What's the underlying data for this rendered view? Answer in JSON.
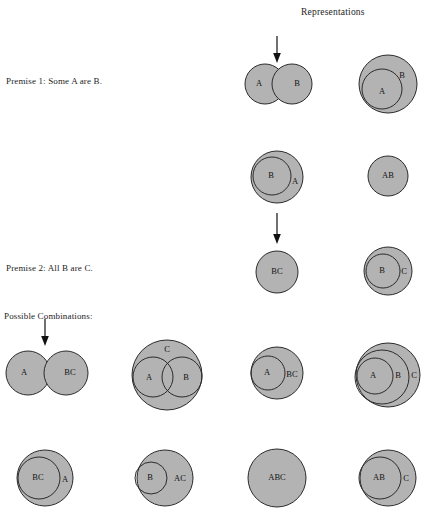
{
  "figure": {
    "title": "Representations",
    "background_color": "#ffffff",
    "disc_fill_color": "#b3b3b3",
    "stroke_color": "#2b2b2b",
    "text_color": "#1d1d1d"
  },
  "labels": {
    "premise_1": "Premise 1:  Some A are B.",
    "premise_2": "Premise 2:  All B are C.",
    "possible_combinations": "Possible Combinations:"
  },
  "arrows": [
    {
      "name": "arrow-to-representations",
      "x": 277,
      "y_start": 36,
      "y_end": 62
    },
    {
      "name": "arrow-premise1-to-premise2",
      "x": 277,
      "y_start": 213,
      "y_end": 243
    },
    {
      "name": "arrow-to-possible-combinations",
      "x": 45,
      "y_start": 319,
      "y_end": 345
    }
  ],
  "diagrams": {
    "premise_1_row": [
      {
        "name": "venn-a-overlap-b",
        "kind": "overlap",
        "circles": [
          {
            "label": "A",
            "cx": 265,
            "cy": 84,
            "r": 20
          },
          {
            "label": "B",
            "cx": 292,
            "cy": 84,
            "r": 20
          }
        ]
      },
      {
        "name": "venn-a-inside-b",
        "kind": "nested",
        "circles": [
          {
            "label": "B",
            "cx": 388,
            "cy": 84,
            "r": 29,
            "filled": true
          },
          {
            "label": "A",
            "cx": 382,
            "cy": 89,
            "r": 20,
            "filled": false
          }
        ]
      }
    ],
    "premise_1_row_2": [
      {
        "name": "venn-b-inside-a",
        "kind": "nested",
        "circles": [
          {
            "label": "A",
            "cx": 277,
            "cy": 177,
            "r": 26,
            "filled": true
          },
          {
            "label": "B",
            "cx": 272,
            "cy": 176,
            "r": 19,
            "filled": false
          }
        ]
      },
      {
        "name": "venn-ab-identical",
        "kind": "single",
        "circles": [
          {
            "label": "AB",
            "cx": 388,
            "cy": 176,
            "r": 20,
            "filled": true
          }
        ]
      }
    ],
    "premise_2_row": [
      {
        "name": "venn-bc-identical",
        "kind": "single",
        "circles": [
          {
            "label": "BC",
            "cx": 277,
            "cy": 272,
            "r": 21,
            "filled": true
          }
        ]
      },
      {
        "name": "venn-b-inside-c",
        "kind": "nested",
        "circles": [
          {
            "label": "C",
            "cx": 388,
            "cy": 271,
            "r": 24,
            "filled": true
          },
          {
            "label": "B",
            "cx": 383,
            "cy": 271,
            "r": 17,
            "filled": false
          }
        ]
      }
    ],
    "possible_combinations_row_1": [
      {
        "name": "combo-a-overlap-bc",
        "kind": "overlap",
        "circles": [
          {
            "label": "A",
            "cx": 28,
            "cy": 373,
            "r": 22
          },
          {
            "label": "BC",
            "cx": 66,
            "cy": 373,
            "r": 22
          }
        ]
      },
      {
        "name": "combo-a-overlap-b-inside-c",
        "kind": "overlap-inside",
        "circles": [
          {
            "label": "C",
            "cx": 167,
            "cy": 375,
            "r": 35,
            "filled": true
          },
          {
            "label": "A",
            "cx": 153,
            "cy": 374,
            "r": 20,
            "filled": false
          },
          {
            "label": "B",
            "cx": 182,
            "cy": 374,
            "r": 20,
            "filled": false
          }
        ]
      },
      {
        "name": "combo-a-inside-bc",
        "kind": "nested",
        "circles": [
          {
            "label": "BC",
            "cx": 277,
            "cy": 373,
            "r": 26,
            "filled": true
          },
          {
            "label": "A",
            "cx": 268,
            "cy": 373,
            "r": 17,
            "filled": false
          }
        ]
      },
      {
        "name": "combo-a-inside-b-inside-c",
        "kind": "nested3",
        "circles": [
          {
            "label": "C",
            "cx": 388,
            "cy": 375,
            "r": 32,
            "filled": true
          },
          {
            "label": "B",
            "cx": 382,
            "cy": 377,
            "r": 27,
            "filled": false
          },
          {
            "label": "A",
            "cx": 375,
            "cy": 376,
            "r": 18,
            "filled": false
          }
        ]
      }
    ],
    "possible_combinations_row_2": [
      {
        "name": "combo-bc-inside-a",
        "kind": "nested",
        "circles": [
          {
            "label": "A",
            "cx": 45,
            "cy": 478,
            "r": 28,
            "filled": true
          },
          {
            "label": "BC",
            "cx": 39,
            "cy": 478,
            "r": 21,
            "filled": false
          }
        ]
      },
      {
        "name": "combo-b-inside-ac",
        "kind": "nested",
        "circles": [
          {
            "label": "AC",
            "cx": 165,
            "cy": 478,
            "r": 28,
            "filled": true
          },
          {
            "label": "B",
            "cx": 151,
            "cy": 478,
            "r": 16,
            "filled": false
          }
        ]
      },
      {
        "name": "combo-abc-identical",
        "kind": "single",
        "circles": [
          {
            "label": "ABC",
            "cx": 277,
            "cy": 478,
            "r": 29,
            "filled": true
          }
        ]
      },
      {
        "name": "combo-ab-inside-c",
        "kind": "nested",
        "circles": [
          {
            "label": "C",
            "cx": 388,
            "cy": 478,
            "r": 28,
            "filled": true
          },
          {
            "label": "AB",
            "cx": 380,
            "cy": 478,
            "r": 21,
            "filled": false
          }
        ]
      }
    ]
  }
}
